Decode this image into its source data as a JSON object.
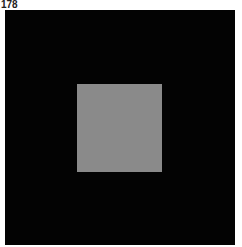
{
  "figure": {
    "label": "178",
    "background_color": "#030303",
    "square_color": "#8a8a8a"
  }
}
